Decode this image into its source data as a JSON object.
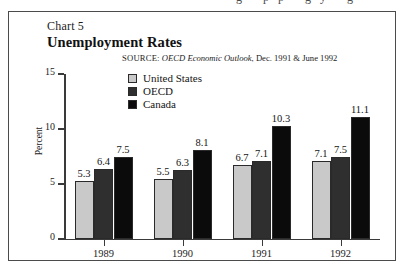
{
  "page": {
    "bleed_text": "g pp gy g"
  },
  "figure": {
    "chart_label": "Chart 5",
    "title": "Unemployment Rates",
    "source_keyword": "SOURCE:",
    "source_publication": "OECD Economic Outlook",
    "source_suffix": ", Dec. 1991 & June 1992"
  },
  "chart_data": {
    "type": "bar",
    "title": "Unemployment Rates",
    "xlabel": "",
    "ylabel": "Percent",
    "ylim": [
      0,
      15
    ],
    "yticks": [
      "0",
      "5",
      "10",
      "15"
    ],
    "ytick_values": [
      0,
      5,
      10,
      15
    ],
    "grid": false,
    "legend_position": "top-left-inside",
    "categories": [
      "1989",
      "1990",
      "1991",
      "1992"
    ],
    "series": [
      {
        "name": "United States",
        "color": "#c9c9c9",
        "values": [
          5.3,
          5.5,
          6.7,
          7.1
        ],
        "labels": [
          "5.3",
          "5.5",
          "6.7",
          "7.1"
        ]
      },
      {
        "name": "OECD",
        "color": "#2f2f2f",
        "values": [
          6.4,
          6.3,
          7.1,
          7.5
        ],
        "labels": [
          "6.4",
          "6.3",
          "7.1",
          "7.5"
        ]
      },
      {
        "name": "Canada",
        "color": "#0b0b0b",
        "values": [
          7.5,
          8.1,
          10.3,
          11.1
        ],
        "labels": [
          "7.5",
          "8.1",
          "10.3",
          "11.1"
        ]
      }
    ]
  }
}
